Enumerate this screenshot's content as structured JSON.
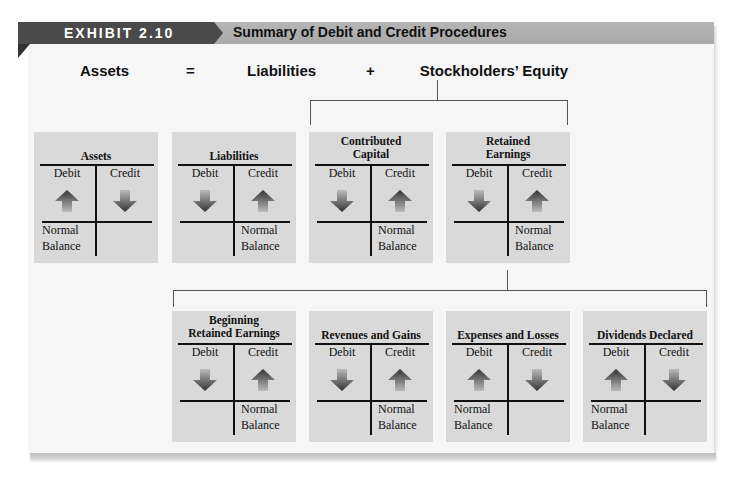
{
  "header": {
    "exhibit_label": "EXHIBIT 2.10",
    "title": "Summary of Debit and Credit Procedures"
  },
  "equation": {
    "assets": "Assets",
    "equals": "=",
    "liabilities": "Liabilities",
    "plus": "+",
    "equity": "Stockholders’ Equity"
  },
  "labels": {
    "debit": "Debit",
    "credit": "Credit",
    "normal": "Normal",
    "balance": "Balance"
  },
  "accounts": [
    {
      "title1": "",
      "title2": "Assets",
      "debit": "increase",
      "credit": "decrease",
      "normal_balance": "debit"
    },
    {
      "title1": "",
      "title2": "Liabilities",
      "debit": "decrease",
      "credit": "increase",
      "normal_balance": "credit"
    },
    {
      "title1": "Contributed",
      "title2": "Capital",
      "debit": "decrease",
      "credit": "increase",
      "normal_balance": "credit"
    },
    {
      "title1": "Retained",
      "title2": "Earnings",
      "debit": "decrease",
      "credit": "increase",
      "normal_balance": "credit"
    },
    {
      "title1": "Beginning",
      "title2": "Retained Earnings",
      "debit": "decrease",
      "credit": "increase",
      "normal_balance": "credit"
    },
    {
      "title1": "",
      "title2": "Revenues and Gains",
      "debit": "decrease",
      "credit": "increase",
      "normal_balance": "credit"
    },
    {
      "title1": "",
      "title2": "Expenses and Losses",
      "debit": "increase",
      "credit": "decrease",
      "normal_balance": "debit"
    },
    {
      "title1": "",
      "title2": "Dividends Declared",
      "debit": "increase",
      "credit": "decrease",
      "normal_balance": "debit"
    }
  ],
  "colors": {
    "header_dark": "#4a4a4a",
    "header_light": "#b0b0b0",
    "box_bg": "#d9d9d9",
    "panel_bg": "#f6f6f6"
  }
}
